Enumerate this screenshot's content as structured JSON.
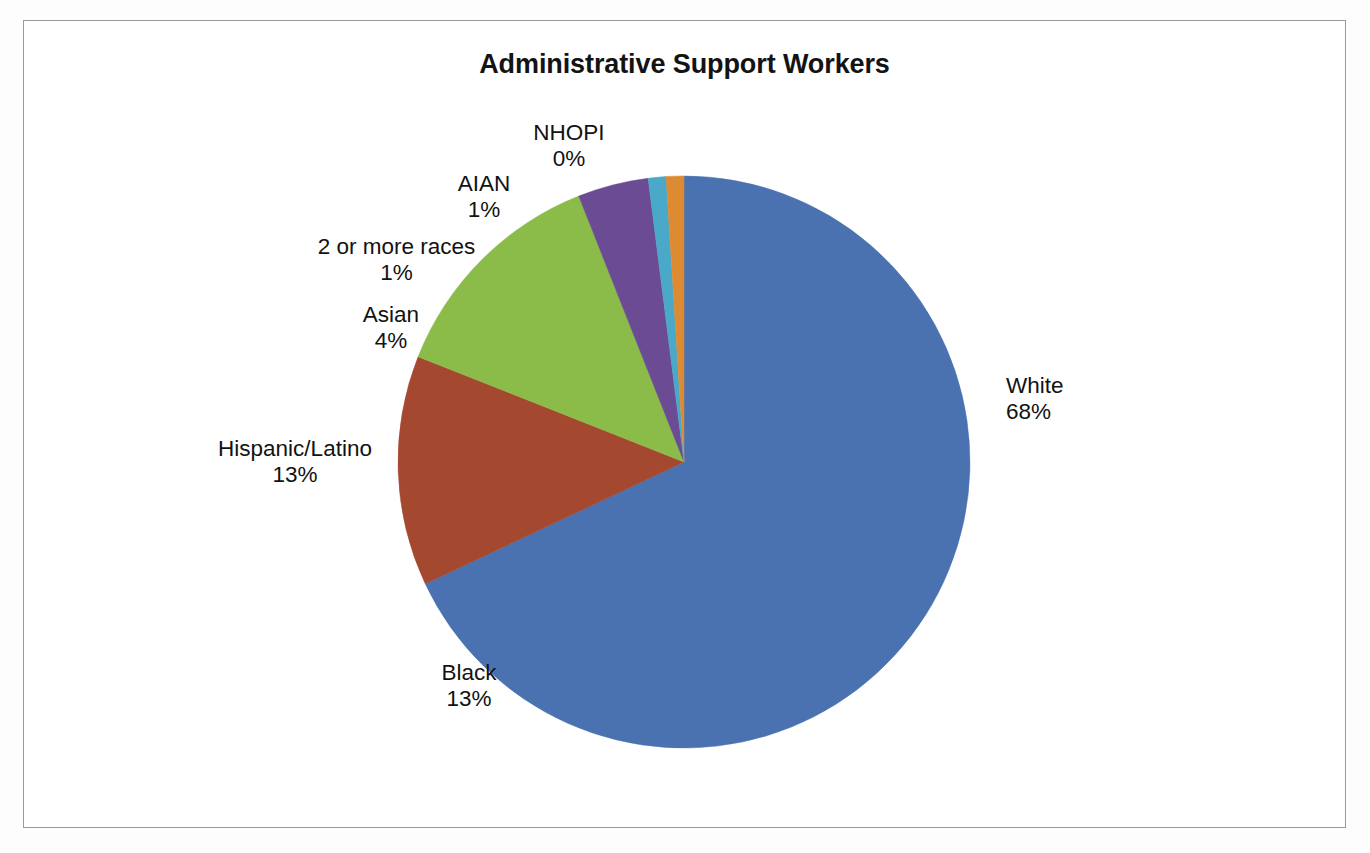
{
  "chart_data": {
    "type": "pie",
    "title": "Administrative Support Workers",
    "xlabel": "",
    "ylabel": "",
    "legend": "none",
    "grid": false,
    "value_format": "percent",
    "categories": [
      "White",
      "Black",
      "Hispanic/Latino",
      "Asian",
      "2 or more races",
      "AIAN",
      "NHOPI"
    ],
    "values": [
      68,
      13,
      13,
      4,
      1,
      1,
      0
    ],
    "colors": [
      "#4a72b0",
      "#a4482f",
      "#8bbc4a",
      "#6b4b94",
      "#4aa8c8",
      "#dd8b33",
      "#1f5d8c"
    ],
    "slices": [
      {
        "label": "White",
        "percent": 68,
        "percent_text": "68%",
        "color": "#4a72b0"
      },
      {
        "label": "Black",
        "percent": 13,
        "percent_text": "13%",
        "color": "#a4482f"
      },
      {
        "label": "Hispanic/Latino",
        "percent": 13,
        "percent_text": "13%",
        "color": "#8bbc4a"
      },
      {
        "label": "Asian",
        "percent": 4,
        "percent_text": "4%",
        "color": "#6b4b94"
      },
      {
        "label": "2 or more races",
        "percent": 1,
        "percent_text": "1%",
        "color": "#4aa8c8"
      },
      {
        "label": "AIAN",
        "percent": 1,
        "percent_text": "1%",
        "color": "#dd8b33"
      },
      {
        "label": "NHOPI",
        "percent": 0,
        "percent_text": "0%",
        "color": "#1f5d8c"
      }
    ]
  },
  "frame": {
    "border_color": "#9a9a9e",
    "background": "#ffffff"
  }
}
